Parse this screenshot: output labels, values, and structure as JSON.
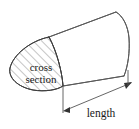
{
  "figure": {
    "type": "geometry-diagram",
    "background_color": "#ffffff",
    "outline_color": "#4a4a4a",
    "hatch_color": "#6e6e6e",
    "text_color": "#1a1a1a",
    "labels": {
      "cross_section_line1": "cross",
      "cross_section_line2": "section",
      "length": "length"
    },
    "icons": {
      "arrow_left": "arrow-left-icon",
      "arrow_right": "arrow-right-icon"
    },
    "annotations": [
      {
        "name": "cross-section-label",
        "text": "cross section",
        "target": "hatched elliptical end face on the left of the solid"
      },
      {
        "name": "length-label",
        "text": "length",
        "target": "double-headed dimension line spanning the extrusion direction"
      }
    ]
  }
}
